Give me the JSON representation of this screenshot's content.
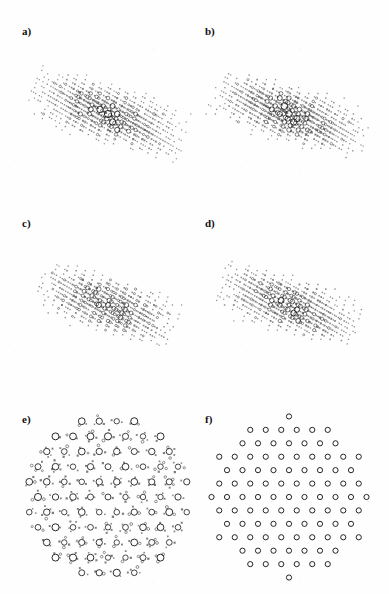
{
  "figure": {
    "background_color": "#fefefe",
    "ink_color": "#1a1a1a",
    "width": 389,
    "height": 594,
    "rows": 3,
    "columns": 2
  },
  "panels": [
    {
      "id": "a",
      "label": "a)",
      "label_x": 22,
      "label_y": 32,
      "cx": 108,
      "cy": 114,
      "radius": 86,
      "pattern": "quasiperiodic-dense",
      "symmetry": 12,
      "seed": 11,
      "point_count": 560,
      "max_marker_radius": 3.6,
      "min_marker_radius": 0.5,
      "filled_fraction": 0.34,
      "description": "Dense quasi-periodic point set, open circles of many sizes mixed with small filled squares"
    },
    {
      "id": "b",
      "label": "b)",
      "label_x": 205,
      "label_y": 32,
      "cx": 289,
      "cy": 114,
      "radius": 86,
      "pattern": "quasiperiodic-dense",
      "symmetry": 12,
      "seed": 23,
      "point_count": 520,
      "max_marker_radius": 3.8,
      "min_marker_radius": 0.5,
      "filled_fraction": 0.4,
      "description": "Dense quasi-periodic point set, slightly coarser than panel a with more filled markers"
    },
    {
      "id": "c",
      "label": "c)",
      "label_x": 22,
      "label_y": 224,
      "cx": 108,
      "cy": 305,
      "radius": 82,
      "pattern": "quasiperiodic-medium",
      "symmetry": 12,
      "seed": 37,
      "point_count": 430,
      "max_marker_radius": 3.4,
      "min_marker_radius": 0.5,
      "filled_fraction": 0.22,
      "description": "Medium density quasi-periodic set, predominantly open circles on a light field"
    },
    {
      "id": "d",
      "label": "d)",
      "label_x": 205,
      "label_y": 224,
      "cx": 289,
      "cy": 305,
      "radius": 82,
      "pattern": "quasiperiodic-clustered",
      "symmetry": 12,
      "seed": 53,
      "point_count": 470,
      "max_marker_radius": 3.4,
      "min_marker_radius": 0.5,
      "filled_fraction": 0.45,
      "description": "Clustered quasi-periodic set with dark satellite groups around large open circles"
    },
    {
      "id": "e",
      "label": "e)",
      "label_x": 22,
      "label_y": 414,
      "cx": 108,
      "cy": 497,
      "radius": 84,
      "pattern": "superlattice-clustered",
      "symmetry": 6,
      "seed": 71,
      "point_count": 400,
      "max_marker_radius": 3.6,
      "min_marker_radius": 0.5,
      "filled_fraction": 0.38,
      "description": "Hexagonal superlattice with satellite dot clusters around each main open circle"
    },
    {
      "id": "f",
      "label": "f)",
      "label_x": 205,
      "label_y": 414,
      "cx": 289,
      "cy": 497,
      "radius": 84,
      "pattern": "triangular-lattice",
      "symmetry": 6,
      "seed": 97,
      "point_count": 160,
      "max_marker_radius": 2.6,
      "min_marker_radius": 2.2,
      "filled_fraction": 0.0,
      "lattice_spacing": 15.5,
      "rows": 17,
      "description": "Clean triangular (hexagonal) lattice of uniform open circles only"
    }
  ]
}
